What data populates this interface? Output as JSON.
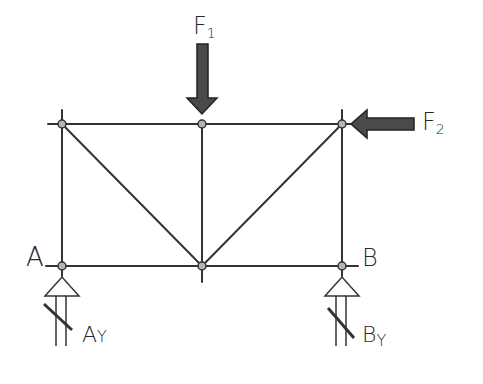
{
  "diagram": {
    "type": "truss",
    "style": "hand-drawn sketch",
    "nodes": [
      {
        "id": "A",
        "label": "A",
        "x": 62,
        "y": 266
      },
      {
        "id": "B",
        "label": "B",
        "x": 342,
        "y": 266
      },
      {
        "id": "bottom_mid",
        "label": "",
        "x": 202,
        "y": 266
      },
      {
        "id": "top_left",
        "label": "",
        "x": 62,
        "y": 124
      },
      {
        "id": "top_mid",
        "label": "",
        "x": 202,
        "y": 124
      },
      {
        "id": "top_right",
        "label": "",
        "x": 342,
        "y": 124
      }
    ],
    "members": [
      [
        "top_left",
        "top_mid"
      ],
      [
        "top_mid",
        "top_right"
      ],
      [
        "A",
        "bottom_mid"
      ],
      [
        "bottom_mid",
        "B"
      ],
      [
        "A",
        "top_left"
      ],
      [
        "B",
        "top_right"
      ],
      [
        "top_mid",
        "bottom_mid"
      ],
      [
        "top_left",
        "bottom_mid"
      ],
      [
        "top_right",
        "bottom_mid"
      ]
    ],
    "loads": [
      {
        "name": "F",
        "subscript": "1",
        "node": "top_mid",
        "direction": "down"
      },
      {
        "name": "F",
        "subscript": "2",
        "node": "top_right",
        "direction": "left"
      }
    ],
    "reactions": [
      {
        "name": "A",
        "subscript": "Y",
        "node": "A",
        "direction": "up"
      },
      {
        "name": "B",
        "subscript": "Y",
        "node": "B",
        "direction": "up"
      }
    ],
    "colors": {
      "line": "#333333",
      "arrow_fill": "#4a4a4a",
      "node_fill": "#b5b5b5"
    }
  }
}
